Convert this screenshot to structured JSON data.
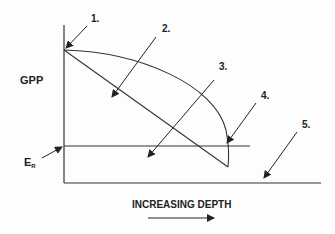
{
  "diagram": {
    "y_axis_label": "GPP",
    "x_axis_label": "INCREASING DEPTH",
    "er_label_main": "E",
    "er_label_sub": "R",
    "callouts": [
      "1.",
      "2.",
      "3.",
      "4.",
      "5."
    ],
    "colors": {
      "line": "#333333",
      "text": "#222222",
      "background": "#fdfdfd"
    }
  }
}
